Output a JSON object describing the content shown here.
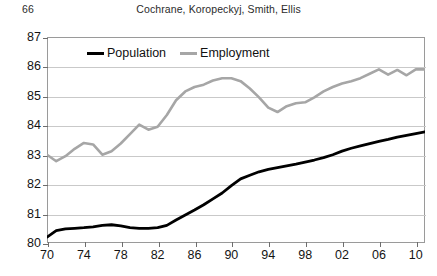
{
  "page": {
    "folio": "66",
    "running_title": "Cochrane, Koropeckyj, Smith, Ellis",
    "caption_sliver": ""
  },
  "legend": {
    "population_label": "Population",
    "employment_label": "Employment",
    "population_color": "#000000",
    "employment_color": "#a6a6a6",
    "position": "top-center-inside"
  },
  "chart_data": {
    "type": "line",
    "title": "",
    "subtitle": "",
    "xlabel": "",
    "ylabel": "",
    "xlim": [
      1970,
      2011
    ],
    "ylim": [
      80,
      87
    ],
    "ytick_values": [
      80,
      81,
      82,
      83,
      84,
      85,
      86,
      87
    ],
    "ytick_labels": [
      "80",
      "81",
      "82",
      "83",
      "84",
      "85",
      "86",
      "87"
    ],
    "xtick_values": [
      1970,
      1974,
      1978,
      1982,
      1986,
      1990,
      1994,
      1998,
      2002,
      2006,
      2010
    ],
    "xtick_labels": [
      "70",
      "74",
      "78",
      "82",
      "86",
      "90",
      "94",
      "98",
      "02",
      "06",
      "10"
    ],
    "grid": "horizontal",
    "legend_position": "top-center",
    "x": [
      1970,
      1971,
      1972,
      1973,
      1974,
      1975,
      1976,
      1977,
      1978,
      1979,
      1980,
      1981,
      1982,
      1983,
      1984,
      1985,
      1986,
      1987,
      1988,
      1989,
      1990,
      1991,
      1992,
      1993,
      1994,
      1995,
      1996,
      1997,
      1998,
      1999,
      2000,
      2001,
      2002,
      2003,
      2004,
      2005,
      2006,
      2007,
      2008,
      2009,
      2010,
      2011
    ],
    "series": [
      {
        "name": "Population",
        "color": "#000000",
        "values": [
          80.2,
          80.42,
          80.48,
          80.5,
          80.52,
          80.55,
          80.6,
          80.62,
          80.58,
          80.52,
          80.5,
          80.5,
          80.52,
          80.6,
          80.78,
          80.95,
          81.12,
          81.3,
          81.5,
          81.7,
          81.95,
          82.18,
          82.3,
          82.42,
          82.5,
          82.56,
          82.62,
          82.68,
          82.75,
          82.82,
          82.9,
          83.0,
          83.12,
          83.22,
          83.3,
          83.38,
          83.45,
          83.52,
          83.6,
          83.66,
          83.72,
          83.78
        ]
      },
      {
        "name": "Employment",
        "color": "#a6a6a6",
        "values": [
          83.0,
          82.78,
          82.95,
          83.2,
          83.4,
          83.35,
          83.0,
          83.12,
          83.38,
          83.7,
          84.02,
          83.85,
          83.95,
          84.35,
          84.85,
          85.15,
          85.3,
          85.38,
          85.52,
          85.6,
          85.6,
          85.5,
          85.25,
          84.95,
          84.6,
          84.45,
          84.65,
          84.75,
          84.78,
          84.95,
          85.15,
          85.3,
          85.42,
          85.5,
          85.6,
          85.75,
          85.9,
          85.72,
          85.88,
          85.7,
          85.9,
          85.9
        ]
      }
    ]
  }
}
